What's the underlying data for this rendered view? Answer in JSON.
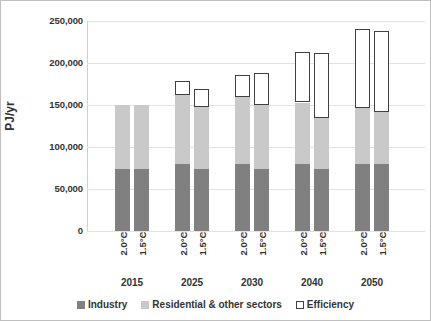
{
  "chart_data": {
    "type": "bar",
    "stacked": true,
    "title": "",
    "xlabel": "",
    "ylabel": "PJ/yr",
    "ylim": [
      0,
      250000
    ],
    "ytick_values": [
      0,
      50000,
      100000,
      150000,
      200000,
      250000
    ],
    "ytick_labels": [
      "0",
      "50,000",
      "100,000",
      "150,000",
      "200,000",
      "250,000"
    ],
    "grid": true,
    "legend_position": "bottom",
    "group_labels": [
      "2015",
      "2025",
      "2030",
      "2040",
      "2050"
    ],
    "scenario_labels": [
      "2.0°C",
      "1.5°C"
    ],
    "series": [
      {
        "name": "Industry",
        "color": "#808080",
        "values": [
          74000,
          74000,
          80000,
          74000,
          80000,
          74000,
          80000,
          74000,
          80000,
          80000
        ]
      },
      {
        "name": "Residential & other sectors",
        "color": "#c9c9c9",
        "values": [
          76000,
          76000,
          82000,
          74000,
          80000,
          76000,
          73000,
          61000,
          66000,
          62000
        ]
      },
      {
        "name": "Efficiency",
        "color": "#ffffff",
        "values": [
          0,
          0,
          17000,
          21000,
          26000,
          38000,
          60000,
          77000,
          94000,
          100000
        ]
      }
    ],
    "bars": [
      {
        "group": "2015",
        "scenario": "2.0°C",
        "industry": 74000,
        "residential": 76000,
        "efficiency": 0,
        "total": 150000
      },
      {
        "group": "2015",
        "scenario": "1.5°C",
        "industry": 74000,
        "residential": 76000,
        "efficiency": 0,
        "total": 150000
      },
      {
        "group": "2025",
        "scenario": "2.0°C",
        "industry": 80000,
        "residential": 82000,
        "efficiency": 17000,
        "total": 179000
      },
      {
        "group": "2025",
        "scenario": "1.5°C",
        "industry": 74000,
        "residential": 74000,
        "efficiency": 21000,
        "total": 169000
      },
      {
        "group": "2030",
        "scenario": "2.0°C",
        "industry": 80000,
        "residential": 80000,
        "efficiency": 26000,
        "total": 186000
      },
      {
        "group": "2030",
        "scenario": "1.5°C",
        "industry": 74000,
        "residential": 76000,
        "efficiency": 38000,
        "total": 188000
      },
      {
        "group": "2040",
        "scenario": "2.0°C",
        "industry": 80000,
        "residential": 73000,
        "efficiency": 60000,
        "total": 213000
      },
      {
        "group": "2040",
        "scenario": "1.5°C",
        "industry": 74000,
        "residential": 61000,
        "efficiency": 77000,
        "total": 212000
      },
      {
        "group": "2050",
        "scenario": "2.0°C",
        "industry": 80000,
        "residential": 66000,
        "efficiency": 94000,
        "total": 240000
      },
      {
        "group": "2050",
        "scenario": "1.5°C",
        "industry": 80000,
        "residential": 62000,
        "efficiency": 96000,
        "total": 238000
      }
    ],
    "legend": [
      {
        "label": "Industry",
        "color": "#808080"
      },
      {
        "label": "Residential & other sectors",
        "color": "#c9c9c9"
      },
      {
        "label": "Efficiency",
        "color": "#ffffff"
      }
    ]
  }
}
